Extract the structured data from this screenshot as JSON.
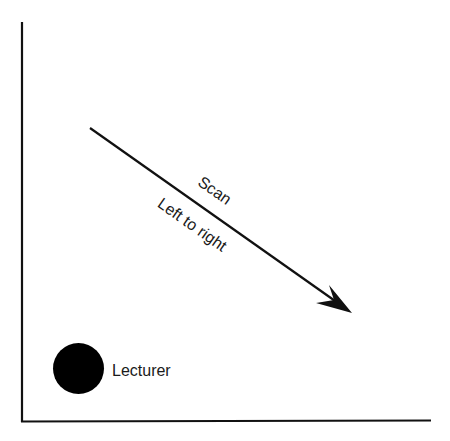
{
  "diagram": {
    "type": "classroom-scan-direction",
    "axes": {
      "stroke_color": "#111111"
    },
    "arrow": {
      "label_above": "Scan",
      "label_below": "Left to right",
      "color": "#111111",
      "start": [
        90,
        128
      ],
      "end": [
        352,
        313
      ]
    },
    "marker": {
      "label": "Lecturer",
      "color": "#000000"
    }
  }
}
